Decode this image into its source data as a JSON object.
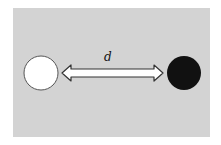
{
  "diagram": {
    "background_color": "#d3d3d3",
    "left_circle": {
      "fill": "#ffffff",
      "stroke": "#555555"
    },
    "right_circle": {
      "fill": "#111111"
    },
    "arrow": {
      "type": "double-headed",
      "fill": "#ffffff",
      "stroke": "#333333"
    },
    "distance_label": "d"
  }
}
